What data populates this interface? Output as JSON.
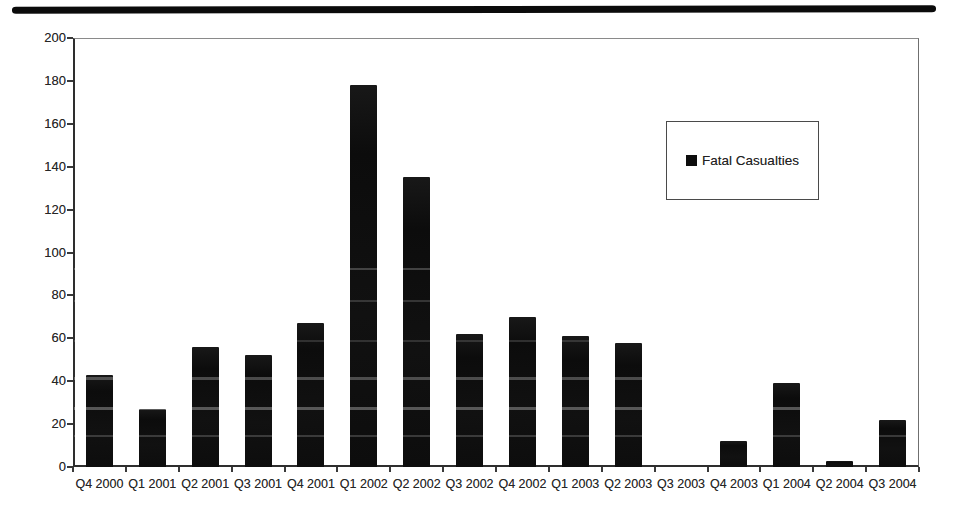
{
  "page": {
    "background_color": "#ffffff",
    "scan_artifact_bar": true
  },
  "chart_data": {
    "type": "bar",
    "title": "",
    "xlabel": "",
    "ylabel": "",
    "categories": [
      "Q4 2000",
      "Q1 2001",
      "Q2 2001",
      "Q3 2001",
      "Q4 2001",
      "Q1 2002",
      "Q2 2002",
      "Q3 2002",
      "Q4 2002",
      "Q1 2003",
      "Q2 2003",
      "Q3 2003",
      "Q4 2003",
      "Q1 2004",
      "Q2 2004",
      "Q3 2004"
    ],
    "series": [
      {
        "name": "Fatal Casualties",
        "values": [
          43,
          27,
          56,
          52,
          67,
          178,
          135,
          62,
          70,
          61,
          58,
          0,
          12,
          39,
          3,
          22
        ],
        "color": "#0d0d0d"
      }
    ],
    "ylim": [
      0,
      200
    ],
    "ytick_step": 20,
    "ytick_labels": [
      "0",
      "20",
      "40",
      "60",
      "80",
      "100",
      "120",
      "140",
      "160",
      "180",
      "200"
    ],
    "grid": false,
    "legend": {
      "position": "upper-right",
      "entries": [
        "Fatal Casualties"
      ],
      "marker_color": "#0d0d0d",
      "border_color": "#4a4a4a"
    }
  }
}
